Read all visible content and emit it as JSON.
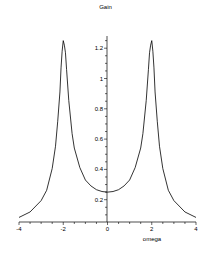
{
  "chart_data": {
    "type": "line",
    "title": "Gain",
    "xlabel": "omega",
    "ylabel": "",
    "xlim": [
      -4,
      4
    ],
    "ylim": [
      0.05,
      1.3
    ],
    "grid": false,
    "legend": null,
    "x_ticks": [
      -4,
      -2,
      0,
      2,
      4
    ],
    "x_tick_labels": [
      "-4",
      "-2",
      "0",
      "2",
      "4"
    ],
    "y_ticks": [
      0.2,
      0.4,
      0.6,
      0.8,
      1,
      1.2
    ],
    "y_tick_labels": [
      "0.2",
      "0.4",
      "0.6",
      "0.8",
      "1",
      "1.2"
    ],
    "series": [
      {
        "name": "Gain",
        "color": "#000000",
        "x": [
          -4,
          -3.5,
          -3,
          -2.75,
          -2.5,
          -2.35,
          -2.25,
          -2.15,
          -2.1,
          -2.05,
          -2,
          -1.95,
          -1.9,
          -1.85,
          -1.75,
          -1.6,
          -1.5,
          -1.25,
          -1,
          -0.75,
          -0.5,
          -0.25,
          0,
          0.25,
          0.5,
          0.75,
          1,
          1.25,
          1.5,
          1.6,
          1.75,
          1.85,
          1.9,
          1.95,
          2,
          2.05,
          2.1,
          2.15,
          2.25,
          2.35,
          2.5,
          2.75,
          3,
          3.5,
          4
        ],
        "values": [
          0.083,
          0.119,
          0.194,
          0.262,
          0.406,
          0.553,
          0.718,
          0.911,
          1.07,
          1.18,
          1.25,
          1.22,
          1.17,
          1.06,
          0.855,
          0.636,
          0.541,
          0.412,
          0.33,
          0.291,
          0.266,
          0.254,
          0.25,
          0.254,
          0.266,
          0.291,
          0.33,
          0.412,
          0.541,
          0.636,
          0.855,
          1.06,
          1.17,
          1.22,
          1.25,
          1.18,
          1.07,
          0.911,
          0.718,
          0.553,
          0.406,
          0.262,
          0.194,
          0.119,
          0.083
        ]
      }
    ]
  },
  "labels": {
    "title": "Gain",
    "xlabel": "omega"
  }
}
